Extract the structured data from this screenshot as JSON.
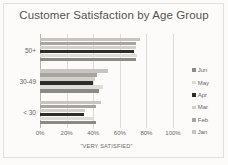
{
  "chart_data": {
    "type": "bar",
    "orientation": "horizontal",
    "title": "Customer Satisfaction by Age Group",
    "xlabel": "\"VERY SATISFIED\"",
    "ylabel": "",
    "categories": [
      "50+",
      "30-49",
      "< 30"
    ],
    "xlim": [
      0,
      100
    ],
    "xticks": [
      "0%",
      "20%",
      "40%",
      "60%",
      "80%",
      "100%"
    ],
    "xtick_values": [
      0,
      20,
      40,
      60,
      80,
      100
    ],
    "grid": true,
    "legend_position": "right",
    "legend_order": [
      "Jun",
      "May",
      "Apr",
      "Mar",
      "Feb",
      "Jan"
    ],
    "series": [
      {
        "name": "Jan",
        "values": [
          75,
          51,
          46
        ],
        "color": "#c8c5c0"
      },
      {
        "name": "Feb",
        "values": [
          72,
          43,
          42
        ],
        "color": "#a8a5a0"
      },
      {
        "name": "Mar",
        "values": [
          72,
          41,
          34
        ],
        "color": "#d3d0cb"
      },
      {
        "name": "Apr",
        "values": [
          71,
          40,
          33
        ],
        "color": "#2f2d2b"
      },
      {
        "name": "May",
        "values": [
          73,
          47,
          40
        ],
        "color": "#e0ddd8"
      },
      {
        "name": "Jun",
        "values": [
          72,
          44,
          42
        ],
        "color": "#8d8a85"
      }
    ]
  },
  "colors": {
    "background": "#fcfbf9",
    "title_text": "#56524d",
    "axis_text": "#6b6762",
    "gridline": "#dedbd5",
    "axis_line": "#b9b5ae"
  }
}
